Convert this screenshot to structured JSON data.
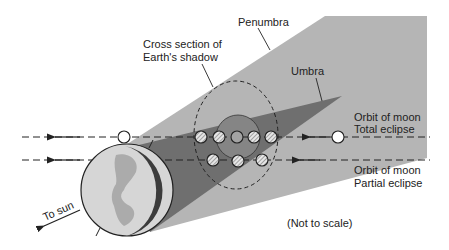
{
  "diagram": {
    "labels": {
      "penumbra": "Penumbra",
      "cross_section_line1": "Cross section of",
      "cross_section_line2": "Earth's shadow",
      "umbra": "Umbra",
      "orbit_total_line1": "Orbit of moon",
      "orbit_total_line2": "Total eclipse",
      "orbit_partial_line1": "Orbit of moon",
      "orbit_partial_line2": "Partial eclipse",
      "to_sun": "To sun",
      "not_to_scale": "(Not to scale)"
    },
    "colors": {
      "penumbra": "#b3b3b3",
      "umbra": "#6e6e6e",
      "inner_umbra": "#8a8a8a",
      "earth": "#d4d4d4",
      "earth_land": "#a9a9a9",
      "earth_night": "#3a3a3a",
      "moon_hatched": "#c8c8c8",
      "moon_full": "#ffffff"
    },
    "moon_positions": {
      "total_eclipse_row": [
        "unshadowed",
        "penumbral",
        "partial",
        "total",
        "partial",
        "penumbral",
        "unshadowed"
      ],
      "partial_eclipse_row": [
        "penumbral",
        "partial",
        "penumbral"
      ]
    }
  }
}
